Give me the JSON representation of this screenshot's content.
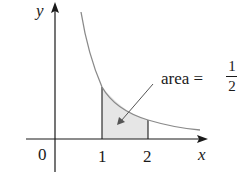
{
  "figure": {
    "axis_labels": {
      "x": "x",
      "y": "y"
    },
    "tick_labels": {
      "origin": "0",
      "one": "1",
      "two": "2"
    },
    "annotation": {
      "text": "area =",
      "numerator": "1",
      "denominator": "2"
    },
    "curve": "y = 1/x",
    "shaded_region": {
      "from": 1,
      "to": 2
    },
    "colors": {
      "curve": "#8a8a8a",
      "axis": "#1a1a1a",
      "shade": "#e6e6e6"
    }
  }
}
